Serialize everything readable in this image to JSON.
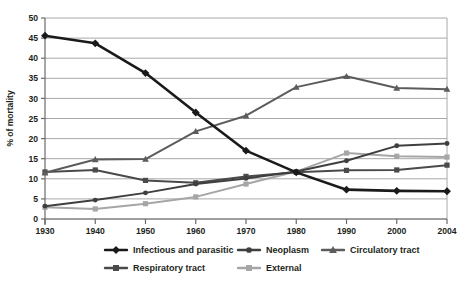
{
  "chart_data": {
    "type": "line",
    "title": "",
    "xlabel": "",
    "ylabel": "% of mortality",
    "x": [
      1930,
      1940,
      1950,
      1960,
      1970,
      1980,
      1990,
      2000,
      2004
    ],
    "categories": [
      "1930",
      "1940",
      "1950",
      "1960",
      "1970",
      "1980",
      "1990",
      "2000",
      "2004"
    ],
    "ylim": [
      0,
      50
    ],
    "yticks": [
      0,
      5,
      10,
      15,
      20,
      25,
      30,
      35,
      40,
      45,
      50
    ],
    "ytick_labels": [
      "0",
      "5",
      "10",
      "15",
      "20",
      "25",
      "30",
      "35",
      "40",
      "45",
      "50"
    ],
    "grid": true,
    "legend_position": "bottom",
    "series": [
      {
        "name": "Infectious and parasitic",
        "color": "#1a1a1a",
        "marker": "diamond",
        "values": [
          45.6,
          43.7,
          36.3,
          26.5,
          17.0,
          11.6,
          7.3,
          7.0,
          6.9
        ]
      },
      {
        "name": "Neoplasm",
        "color": "#3f3f3f",
        "marker": "circle",
        "values": [
          3.2,
          4.7,
          6.5,
          8.7,
          10.1,
          11.8,
          14.5,
          18.2,
          18.8
        ]
      },
      {
        "name": "Circulatory tract",
        "color": "#5c5c5c",
        "marker": "triangle",
        "values": [
          11.5,
          14.8,
          14.9,
          21.8,
          25.7,
          32.8,
          35.5,
          32.6,
          32.3
        ]
      },
      {
        "name": "Respiratory tract",
        "color": "#4a4a4a",
        "marker": "square",
        "values": [
          11.7,
          12.2,
          9.6,
          9.0,
          10.6,
          11.6,
          12.1,
          12.2,
          13.4
        ]
      },
      {
        "name": "External",
        "color": "#a6a6a6",
        "marker": "square",
        "values": [
          2.9,
          2.5,
          3.8,
          5.5,
          8.7,
          11.8,
          16.4,
          15.6,
          15.4
        ]
      }
    ]
  },
  "axis": {
    "y_title": "% of mortality"
  },
  "legend": {
    "items": [
      {
        "label": "Infectious and parasitic",
        "color": "#1a1a1a",
        "marker": "diamond"
      },
      {
        "label": "Neoplasm",
        "color": "#3f3f3f",
        "marker": "circle"
      },
      {
        "label": "Circulatory tract",
        "color": "#5c5c5c",
        "marker": "triangle"
      },
      {
        "label": "Respiratory tract",
        "color": "#4a4a4a",
        "marker": "square"
      },
      {
        "label": "External",
        "color": "#a6a6a6",
        "marker": "square"
      }
    ]
  },
  "colors": {
    "axis": "#6b6b6b",
    "grid": "#a8a8a8",
    "text": "#231f20",
    "background": "#ffffff"
  }
}
